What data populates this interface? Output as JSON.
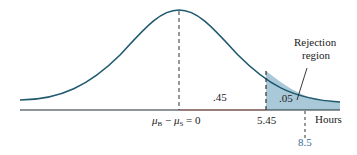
{
  "diagram": {
    "type": "normal-distribution-rejection-region",
    "curve_color": "#1f5a6e",
    "shade_color": "#a9c8d8",
    "axis_color": "#1f2a33",
    "accent_color": "#c0392b",
    "labels": {
      "mean": "μB − μS = 0",
      "mean_mu1": "μ",
      "mean_sub1": "B",
      "mean_minus": " − ",
      "mean_mu2": "μ",
      "mean_sub2": "S",
      "mean_eq": " = 0",
      "critical": "5.45",
      "observed": "8.5",
      "axis_unit": "Hours",
      "center_area": ".45",
      "tail_area": ".05",
      "rejection_line1": "Rejection",
      "rejection_line2": "region"
    }
  }
}
